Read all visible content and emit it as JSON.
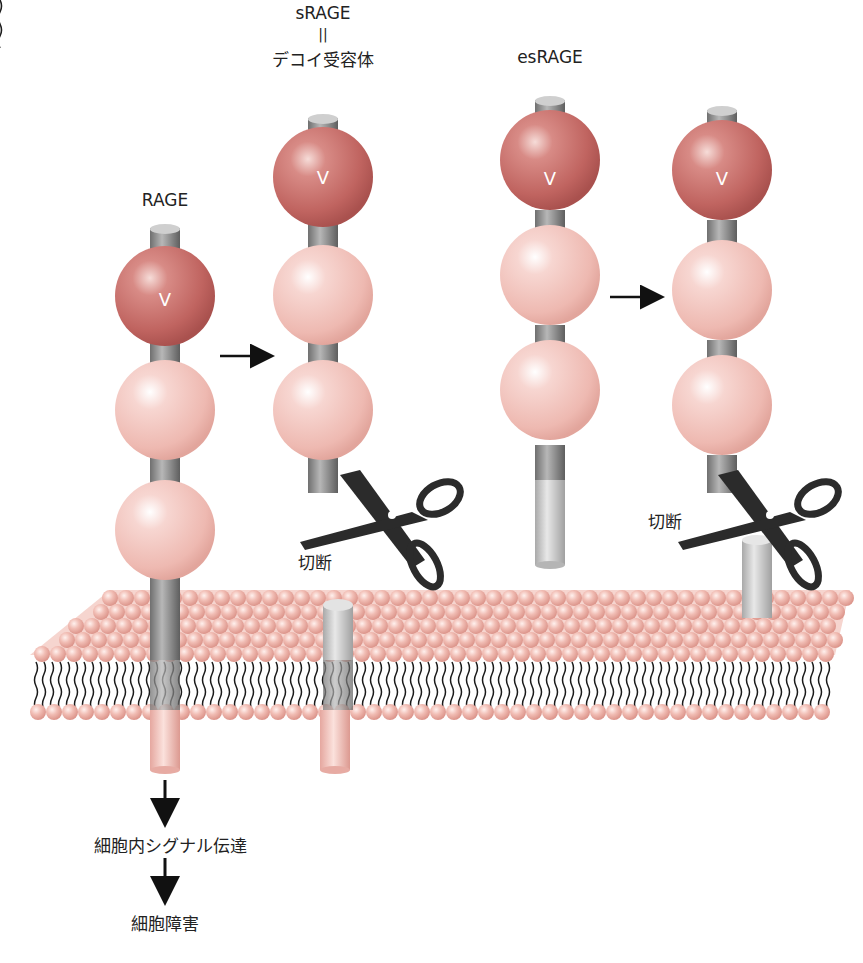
{
  "diagram": {
    "type": "biology-schematic",
    "colors": {
      "v_domain": "#c9706c",
      "c_domain": "#f2c3bd",
      "linker": "#8a8a8a",
      "membrane_head": "#efb7ae",
      "cytoplasmic_tail": "#f0c0b8",
      "scissors": "#2b2b2b",
      "arrow": "#111111"
    },
    "receptors": [
      {
        "id": "rage",
        "label": "RAGE",
        "domains": [
          "V",
          "C1",
          "C2"
        ],
        "anchored": true,
        "cytoplasmic_tail": true
      },
      {
        "id": "srage",
        "label": "sRAGE",
        "label_eq": "||",
        "label_sub": "デコイ受容体",
        "domains": [
          "V",
          "C1",
          "C2"
        ],
        "anchored": false,
        "cleaved": true
      },
      {
        "id": "esrage",
        "label": "esRAGE",
        "domains": [
          "V",
          "C1",
          "C2"
        ],
        "anchored": false,
        "tail": "light-grey"
      },
      {
        "id": "esrage-cleaved",
        "label": "",
        "domains": [
          "V",
          "C1",
          "C2"
        ],
        "anchored": false,
        "cleaved": true
      }
    ],
    "domain_letter": "V",
    "cleavage_label": "切断",
    "cleavage_labels": [
      "切断",
      "切断"
    ],
    "signaling": {
      "step1": "細胞内シグナル伝達",
      "step2": "細胞障害"
    }
  }
}
